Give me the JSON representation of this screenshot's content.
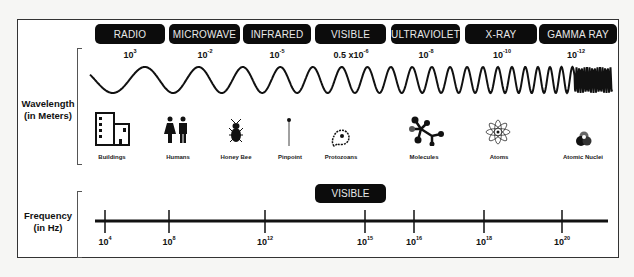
{
  "bands": [
    {
      "label": "RADIO",
      "wavelength_base": "10",
      "wavelength_exp": "3"
    },
    {
      "label": "MICROWAVE",
      "wavelength_base": "10",
      "wavelength_exp": "-2"
    },
    {
      "label": "INFRARED",
      "wavelength_base": "10",
      "wavelength_exp": "-5"
    },
    {
      "label": "VISIBLE",
      "wavelength_base": "0.5 x10",
      "wavelength_exp": "-6"
    },
    {
      "label": "ULTRAVIOLET",
      "wavelength_base": "10",
      "wavelength_exp": "-8"
    },
    {
      "label": "X-RAY",
      "wavelength_base": "10",
      "wavelength_exp": "-10"
    },
    {
      "label": "GAMMA RAY",
      "wavelength_base": "10",
      "wavelength_exp": "-12"
    }
  ],
  "axes": {
    "wavelength": {
      "line1": "Wavelength",
      "line2": "(in Meters)"
    },
    "frequency": {
      "line1": "Frequency",
      "line2": "(in Hz)"
    }
  },
  "scale_objects": [
    {
      "label": "Buildings",
      "icon": "buildings-icon"
    },
    {
      "label": "Humans",
      "icon": "humans-icon"
    },
    {
      "label": "Honey Bee",
      "icon": "honey-bee-icon"
    },
    {
      "label": "Pinpoint",
      "icon": "pinpoint-icon"
    },
    {
      "label": "Protozoans",
      "icon": "protozoan-icon"
    },
    {
      "label": "Molecules",
      "icon": "molecule-icon"
    },
    {
      "label": "Atoms",
      "icon": "atom-icon"
    },
    {
      "label": "Atomic Nuclei",
      "icon": "atomic-nucleus-icon"
    }
  ],
  "frequency": {
    "visible_badge": "VISIBLE",
    "ticks": [
      {
        "base": "10",
        "exp": "4"
      },
      {
        "base": "10",
        "exp": "8"
      },
      {
        "base": "10",
        "exp": "12"
      },
      {
        "base": "10",
        "exp": "15"
      },
      {
        "base": "10",
        "exp": "16"
      },
      {
        "base": "10",
        "exp": "18"
      },
      {
        "base": "10",
        "exp": "20"
      }
    ]
  },
  "colors": {
    "band_bg": "#0c0c0c",
    "band_text": "#e8e8e8",
    "line": "#111111"
  }
}
